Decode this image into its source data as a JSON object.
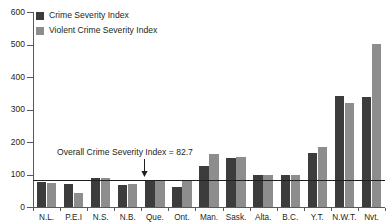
{
  "chart_data": {
    "type": "bar",
    "title": "",
    "xlabel": "",
    "ylabel": "",
    "ylim": [
      0,
      600
    ],
    "ytick_step": 100,
    "grid": false,
    "legend_position": "top-left",
    "categories": [
      "N.L.",
      "P.E.I",
      "N.S.",
      "N.B.",
      "Que.",
      "Ont.",
      "Man.",
      "Sask.",
      "Alta.",
      "B.C.",
      "Y.T.",
      "N.W.T.",
      "Nvt."
    ],
    "ytick_labels": [
      "0",
      "100",
      "200",
      "300",
      "400",
      "500",
      "600"
    ],
    "series": [
      {
        "name": "Crime Severity Index",
        "color": "#3c3c3c",
        "values": [
          77,
          72,
          90,
          68,
          79,
          62,
          127,
          152,
          100,
          100,
          167,
          341,
          340
        ]
      },
      {
        "name": "Violent Crime Severity Index",
        "color": "#8d8d8d",
        "values": [
          75,
          42,
          88,
          70,
          80,
          80,
          163,
          155,
          100,
          100,
          185,
          321,
          502
        ]
      }
    ],
    "annotations": [
      {
        "name": "overall-reference-line",
        "text": "Overall Crime Severity Index = 82.7",
        "value": 82.7,
        "arrow": "down"
      }
    ]
  },
  "legend": {
    "items": [
      {
        "label": "Crime Severity Index",
        "swatch": "dark"
      },
      {
        "label": "Violent Crime Severity Index",
        "swatch": "light"
      }
    ]
  },
  "colors": {
    "series_dark": "#3c3c3c",
    "series_light": "#8d8d8d",
    "axis": "#58595b",
    "text": "#231f20",
    "background": "#ffffff"
  }
}
